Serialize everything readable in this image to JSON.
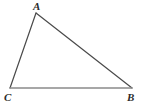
{
  "figure": {
    "kind": "geometry-diagram",
    "shape": "triangle",
    "background_color": "#ffffff",
    "canvas": {
      "width": 141,
      "height": 112
    },
    "vertices": [
      {
        "id": "A",
        "label": "A",
        "x": 36,
        "y": 13,
        "label_x": 33,
        "label_y": 1,
        "label_position": "above"
      },
      {
        "id": "C",
        "label": "C",
        "x": 10,
        "y": 88,
        "label_x": 4,
        "label_y": 92,
        "label_position": "below-left"
      },
      {
        "id": "B",
        "label": "B",
        "x": 132,
        "y": 88,
        "label_x": 127,
        "label_y": 92,
        "label_position": "below-right"
      }
    ],
    "edges": [
      {
        "id": "CA",
        "from": "C",
        "to": "A",
        "x1": 10,
        "y1": 88,
        "x2": 36,
        "y2": 13,
        "color": "#4a4a4a",
        "width": 1.2
      },
      {
        "id": "AB",
        "from": "A",
        "to": "B",
        "x1": 36,
        "y1": 13,
        "x2": 132,
        "y2": 88,
        "color": "#4a4a4a",
        "width": 1.2
      },
      {
        "id": "CB",
        "from": "C",
        "to": "B",
        "x1": 10,
        "y1": 88,
        "x2": 132,
        "y2": 88,
        "color": "#8a8a8a",
        "width": 1.6
      }
    ],
    "label_color": "#2b2b2b"
  }
}
